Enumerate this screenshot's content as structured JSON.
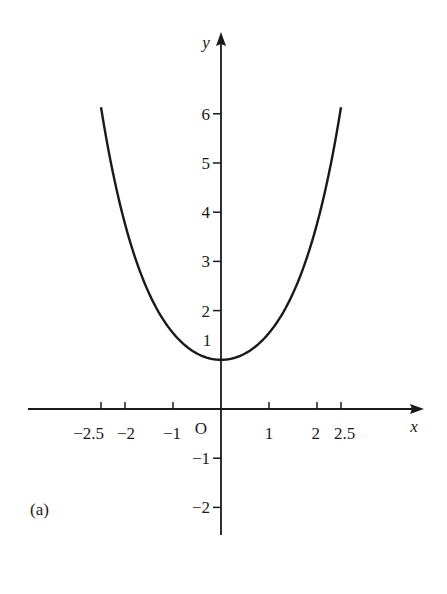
{
  "panel_label": "(a)",
  "axes": {
    "x_label": "x",
    "y_label": "y",
    "origin_label": "O",
    "x_ticks": [
      {
        "value": -2.5,
        "label": "−2.5"
      },
      {
        "value": -2,
        "label": "−2"
      },
      {
        "value": -1,
        "label": "−1"
      },
      {
        "value": 1,
        "label": "1"
      },
      {
        "value": 2,
        "label": "2"
      },
      {
        "value": 2.5,
        "label": "2.5"
      }
    ],
    "y_ticks": [
      {
        "value": 6,
        "label": "6"
      },
      {
        "value": 5,
        "label": "5"
      },
      {
        "value": 4,
        "label": "4"
      },
      {
        "value": 3,
        "label": "3"
      },
      {
        "value": 2,
        "label": "2"
      },
      {
        "value": -1,
        "label": "−1"
      },
      {
        "value": -2,
        "label": "−2"
      }
    ],
    "y_extra_label": {
      "value": 1,
      "label": "1"
    }
  },
  "colors": {
    "ink": "#1a1a1a",
    "background": "#ffffff"
  },
  "chart_data": {
    "type": "line",
    "title": "",
    "xlabel": "x",
    "ylabel": "y",
    "xlim": [
      -4,
      4
    ],
    "ylim": [
      -2.6,
      7.8
    ],
    "grid": false,
    "legend": null,
    "annotations": [
      "(a)",
      "O"
    ],
    "series": [
      {
        "name": "y = cosh x",
        "x": [
          -2.5,
          -2,
          -1.5,
          -1,
          -0.5,
          0,
          0.5,
          1,
          1.5,
          2,
          2.5
        ],
        "y": [
          6.13,
          3.76,
          2.35,
          1.54,
          1.13,
          1.0,
          1.13,
          1.54,
          2.35,
          3.76,
          6.13
        ]
      }
    ]
  }
}
